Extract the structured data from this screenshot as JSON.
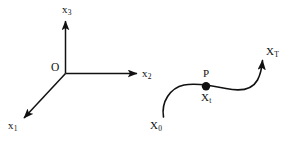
{
  "figure": {
    "type": "diagram",
    "background_color": "#ffffff",
    "stroke_color": "#111111",
    "width": 297,
    "height": 142
  },
  "axes": {
    "origin_label": "O",
    "items": [
      {
        "name": "x-1-axis",
        "base": "x",
        "subscript": "1",
        "direction": "down-left"
      },
      {
        "name": "x-2-axis",
        "base": "x",
        "subscript": "2",
        "direction": "right"
      },
      {
        "name": "x-3-axis",
        "base": "x",
        "subscript": "3",
        "direction": "up"
      }
    ]
  },
  "trajectory": {
    "name": "state-trajectory",
    "start_label": {
      "base": "X",
      "subscript": "0"
    },
    "end_label": {
      "base": "X",
      "subscript": "T"
    },
    "marker": {
      "name": "point-P",
      "label_above": "P",
      "label_below": {
        "base": "X",
        "subscript": "t"
      },
      "dot_color": "#111111"
    }
  }
}
